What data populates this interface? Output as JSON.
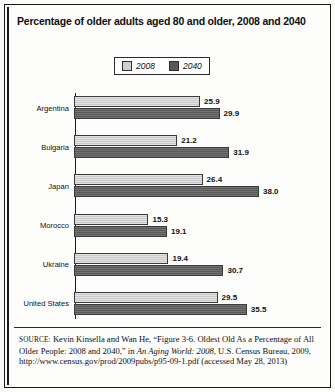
{
  "title": "Percentage of older adults aged 80 and older, 2008 and 2040",
  "legend": {
    "items": [
      {
        "label": "2008",
        "color": "#cdcdcd"
      },
      {
        "label": "2040",
        "color": "#636363"
      }
    ]
  },
  "source": {
    "label": "SOURCE:",
    "text_1": " Kevin Kinsella and Wan He, “Figure 3-6. Oldest Old As a Percentage of All Older People: 2008 and 2040,” in ",
    "italic_1": "An Aging World: 2008",
    "text_2": ", U.S. Census Bureau, 2009, http://www.census.gov/prod/2009pubs/p95-09-1.pdf (accessed May 28, 2013)"
  },
  "chart_data": {
    "type": "bar",
    "orientation": "horizontal",
    "title": "Percentage of older adults aged 80 and older, 2008 and 2040",
    "xlabel": "",
    "ylabel": "",
    "xlim": [
      0,
      38
    ],
    "grid": false,
    "legend_position": "top-center",
    "categories": [
      "Argentina",
      "Bulgaria",
      "Japan",
      "Morocco",
      "Ukraine",
      "United States"
    ],
    "series": [
      {
        "name": "2008",
        "color": "#cdcdcd",
        "values": [
          25.9,
          21.2,
          26.4,
          15.3,
          19.4,
          29.5
        ]
      },
      {
        "name": "2040",
        "color": "#636363",
        "values": [
          29.9,
          31.9,
          38.0,
          19.1,
          30.7,
          35.5
        ]
      }
    ],
    "value_labels": [
      {
        "category": "Argentina",
        "v2008": "25.9",
        "v2040": "29.9"
      },
      {
        "category": "Bulgaria",
        "v2008": "21.2",
        "v2040": "31.9"
      },
      {
        "category": "Japan",
        "v2008": "26.4",
        "v2040": "38.0"
      },
      {
        "category": "Morocco",
        "v2008": "15.3",
        "v2040": "19.1"
      },
      {
        "category": "Ukraine",
        "v2008": "19.4",
        "v2040": "30.7"
      },
      {
        "category": "United States",
        "v2008": "29.5",
        "v2040": "35.5"
      }
    ]
  }
}
